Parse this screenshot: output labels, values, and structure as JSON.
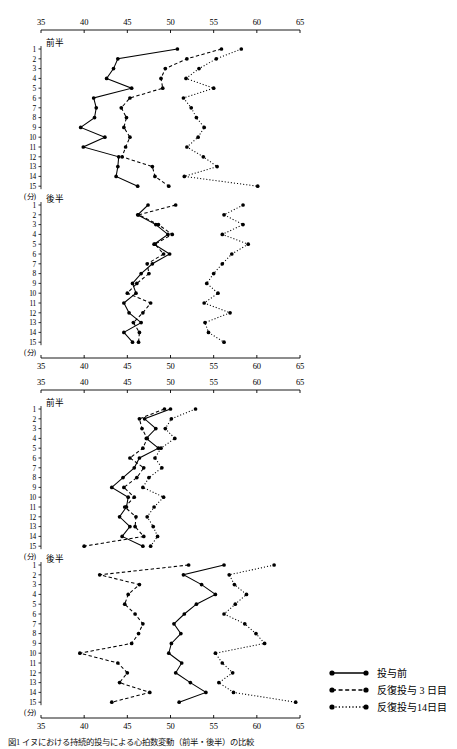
{
  "figure": {
    "caption": "図1 イヌにおける持続的投与による心拍数変動（前半・後半）の比較"
  },
  "axis": {
    "ticks": [
      35,
      40,
      45,
      50,
      55,
      60,
      65
    ],
    "min": 35,
    "max": 65,
    "row_labels": [
      "1",
      "2",
      "3",
      "4",
      "5",
      "6",
      "7",
      "8",
      "9",
      "10",
      "11",
      "12",
      "13",
      "14",
      "15"
    ],
    "unit": "(分)"
  },
  "sections": {
    "first_half": "前半",
    "second_half": "後半"
  },
  "legend": {
    "position": "bottom-right",
    "entries": [
      {
        "label": "投与前",
        "style": "solid",
        "key": "solid-line-key"
      },
      {
        "label": "反復投与 3 日目",
        "style": "dashed",
        "key": "dashed-line-key"
      },
      {
        "label": "反復投与14日目",
        "style": "dotted",
        "key": "dotted-line-key"
      }
    ]
  },
  "chart_data": [
    {
      "type": "line",
      "title": "上段グラフ",
      "panel": 1,
      "xlabel": "",
      "ylabel": "(分)",
      "xlim": [
        35,
        65
      ],
      "grid": false,
      "orientation": "horizontal-value-vertical-index",
      "categories": [
        "1",
        "2",
        "3",
        "4",
        "5",
        "6",
        "7",
        "8",
        "9",
        "10",
        "11",
        "12",
        "13",
        "14",
        "15"
      ],
      "subsections": [
        {
          "name": "前半",
          "series": [
            {
              "name": "投与前",
              "style": "solid",
              "values": [
                50.8,
                43.9,
                43.4,
                42.6,
                45.5,
                41.1,
                41.4,
                41.2,
                39.6,
                42.4,
                39.9,
                44.0,
                43.9,
                43.7,
                46.2
              ]
            },
            {
              "name": "反復投与 3 日目",
              "style": "dashed",
              "values": [
                55.9,
                51.9,
                49.4,
                48.9,
                49.1,
                45.3,
                44.3,
                44.9,
                44.6,
                45.3,
                44.8,
                44.4,
                47.9,
                48.2,
                49.8
              ]
            },
            {
              "name": "反復投与14日目",
              "style": "dotted",
              "values": [
                58.2,
                55.3,
                53.3,
                51.8,
                55.0,
                51.5,
                52.4,
                53.0,
                53.9,
                53.2,
                51.9,
                53.8,
                55.4,
                51.6,
                60.1
              ]
            }
          ]
        },
        {
          "name": "後半",
          "series": [
            {
              "name": "投与前",
              "style": "solid",
              "values": [
                47.4,
                46.2,
                48.3,
                49.7,
                48.1,
                49.9,
                47.9,
                46.6,
                45.6,
                46.0,
                44.6,
                45.2,
                46.6,
                44.6,
                45.6
              ]
            },
            {
              "name": "反復投与 3 日目",
              "style": "dashed",
              "values": [
                50.6,
                46.3,
                48.6,
                50.2,
                48.2,
                49.2,
                47.3,
                47.5,
                46.1,
                45.0,
                47.7,
                46.8,
                45.7,
                46.4,
                46.3
              ]
            },
            {
              "name": "反復投与14日目",
              "style": "dotted",
              "values": [
                58.4,
                56.2,
                58.4,
                56.0,
                59.0,
                57.1,
                56.0,
                55.0,
                54.2,
                55.5,
                53.9,
                56.9,
                54.0,
                54.4,
                56.2
              ]
            }
          ]
        }
      ]
    },
    {
      "type": "line",
      "title": "下段グラフ",
      "panel": 2,
      "xlabel": "",
      "ylabel": "(分)",
      "xlim": [
        35,
        65
      ],
      "grid": false,
      "orientation": "horizontal-value-vertical-index",
      "categories": [
        "1",
        "2",
        "3",
        "4",
        "5",
        "6",
        "7",
        "8",
        "9",
        "10",
        "11",
        "12",
        "13",
        "14",
        "15"
      ],
      "subsections": [
        {
          "name": "前半",
          "series": [
            {
              "name": "投与前",
              "style": "solid",
              "values": [
                50.0,
                47.0,
                48.3,
                47.2,
                48.6,
                46.4,
                45.8,
                44.5,
                43.2,
                45.1,
                44.9,
                44.1,
                45.3,
                44.4,
                46.8
              ]
            },
            {
              "name": "反復投与 3 日目",
              "style": "dashed",
              "values": [
                49.3,
                46.4,
                46.7,
                47.3,
                46.8,
                45.3,
                46.9,
                46.1,
                44.6,
                45.8,
                44.7,
                46.0,
                45.9,
                46.9,
                40.0
              ]
            },
            {
              "name": "反復投与14日目",
              "style": "dotted",
              "values": [
                52.9,
                50.1,
                49.4,
                50.5,
                48.9,
                48.2,
                49.0,
                47.5,
                46.8,
                49.2,
                48.1,
                47.3,
                48.0,
                48.5,
                47.7
              ]
            }
          ]
        },
        {
          "name": "後半",
          "series": [
            {
              "name": "投与前",
              "style": "solid",
              "values": [
                56.2,
                51.5,
                53.6,
                55.2,
                53.0,
                51.6,
                50.4,
                51.2,
                50.1,
                49.8,
                51.3,
                50.6,
                52.3,
                54.1,
                51.0
              ]
            },
            {
              "name": "反復投与 3 日目",
              "style": "dashed",
              "values": [
                52.1,
                41.8,
                46.4,
                45.1,
                44.7,
                45.9,
                46.8,
                46.3,
                45.5,
                39.5,
                43.9,
                45.0,
                44.1,
                47.6,
                43.2
              ]
            },
            {
              "name": "反復投与14日目",
              "style": "dotted",
              "values": [
                62.0,
                56.8,
                57.4,
                58.8,
                57.5,
                56.2,
                58.6,
                59.9,
                60.9,
                55.2,
                56.0,
                57.2,
                55.6,
                57.3,
                64.5
              ]
            }
          ]
        }
      ]
    }
  ]
}
